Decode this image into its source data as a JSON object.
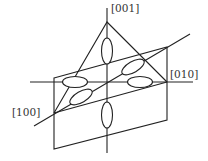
{
  "diagram": {
    "type": "crystallographic-orbital-diagram",
    "axes": [
      {
        "id": "z",
        "label": "[001]"
      },
      {
        "id": "y",
        "label": "[010]"
      },
      {
        "id": "x",
        "label": "[100]"
      }
    ],
    "lobes": {
      "count": 6,
      "description": "ellipsoidal lobes along the three axes"
    },
    "colors": {
      "stroke": "#222222",
      "background": "#ffffff"
    }
  },
  "labels": {
    "axis_001": "[001]",
    "axis_010": "[010]",
    "axis_100": "[100]"
  }
}
